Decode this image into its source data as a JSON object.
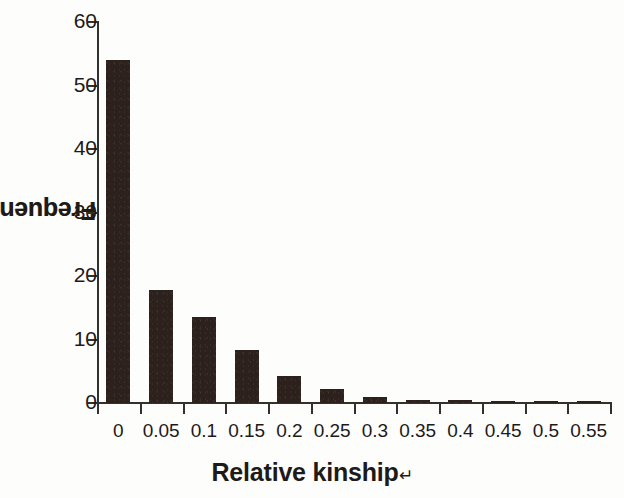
{
  "chart_data": {
    "type": "bar",
    "title": "",
    "xlabel": "Relative kinship",
    "ylabel": "Frequency(%)",
    "xlabel_mark": "↵",
    "ylabel_mark": "↵",
    "categories": [
      "0",
      "0.05",
      "0.1",
      "0.15",
      "0.2",
      "0.25",
      "0.3",
      "0.35",
      "0.4",
      "0.45",
      "0.5",
      "0.55"
    ],
    "values": [
      54.0,
      17.8,
      13.5,
      8.3,
      4.2,
      2.2,
      1.0,
      0.5,
      0.5,
      0.3,
      0.3,
      0.3
    ],
    "ylim": [
      0,
      60
    ],
    "yticks": [
      0,
      10,
      20,
      30,
      40,
      50,
      60
    ],
    "ytick_labels": [
      "0",
      "10",
      "20",
      "30",
      "40",
      "50",
      "60"
    ],
    "grid": false,
    "legend": null,
    "bar_color": "#2c211c",
    "axis_color": "#34302e"
  }
}
